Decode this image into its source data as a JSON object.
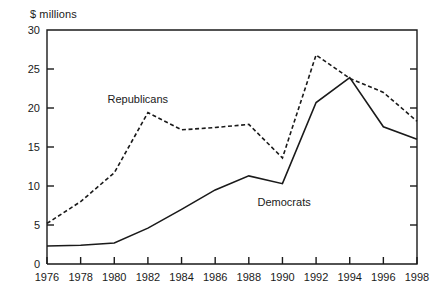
{
  "chart_data": {
    "type": "line",
    "title": "",
    "subtitle": "",
    "unit_label": "$ millions",
    "xlabel": "",
    "ylabel": "$ millions",
    "x": [
      1976,
      1978,
      1980,
      1982,
      1984,
      1986,
      1988,
      1990,
      1992,
      1994,
      1996,
      1998
    ],
    "categories": [
      "1976",
      "1978",
      "1980",
      "1982",
      "1984",
      "1986",
      "1988",
      "1990",
      "1992",
      "1994",
      "1996",
      "1998"
    ],
    "xlim": [
      1976,
      1998
    ],
    "ylim": [
      0,
      30
    ],
    "yticks": [
      0,
      5,
      10,
      15,
      20,
      25,
      30
    ],
    "ytick_labels": [
      "0",
      "5",
      "10",
      "15",
      "20",
      "25",
      "30"
    ],
    "xticks": [
      1976,
      1978,
      1980,
      1982,
      1984,
      1986,
      1988,
      1990,
      1992,
      1994,
      1996,
      1998
    ],
    "grid": false,
    "legend_position": "inline-annotations",
    "series": [
      {
        "name": "Republicans",
        "style": "dashed",
        "color": "#1a1a1a",
        "label_position": {
          "x": 1981.4,
          "y": 20.7
        },
        "values": [
          5.2,
          8.0,
          11.7,
          19.4,
          17.2,
          17.5,
          17.9,
          13.6,
          26.8,
          23.8,
          22.0,
          18.3
        ]
      },
      {
        "name": "Democrats",
        "style": "solid",
        "color": "#1a1a1a",
        "label_position": {
          "x": 1990.1,
          "y": 7.4
        },
        "values": [
          2.3,
          2.4,
          2.7,
          4.6,
          7.0,
          9.5,
          11.3,
          10.3,
          20.7,
          23.9,
          17.6,
          16.0
        ]
      }
    ]
  },
  "axis": {
    "frame_color": "#1a1a1a"
  }
}
